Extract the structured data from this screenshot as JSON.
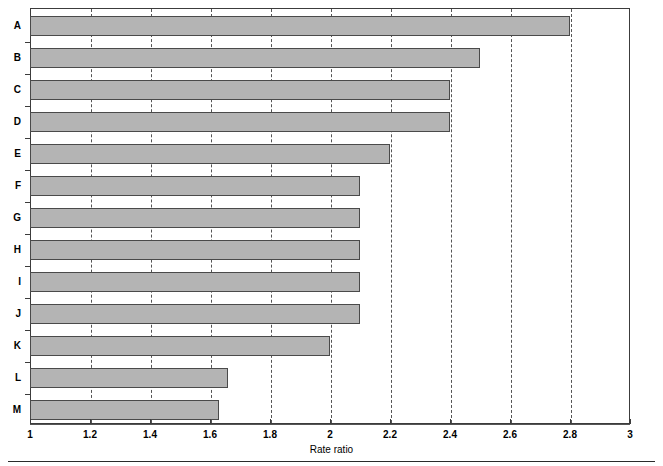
{
  "chart_data": {
    "type": "bar",
    "orientation": "horizontal",
    "title": "",
    "xlabel": "Rate ratio",
    "ylabel": "",
    "xlim": [
      1,
      3
    ],
    "ylim": null,
    "grid": "vertical-dashed",
    "legend": "none",
    "categories": [
      "A",
      "B",
      "C",
      "D",
      "E",
      "F",
      "G",
      "H",
      "I",
      "J",
      "K",
      "L",
      "M"
    ],
    "values": [
      2.8,
      2.5,
      2.4,
      2.4,
      2.2,
      2.1,
      2.1,
      2.1,
      2.1,
      2.1,
      2.0,
      1.66,
      1.63
    ],
    "xticks": [
      1,
      1.2,
      1.4,
      1.6,
      1.8,
      2,
      2.2,
      2.4,
      2.6,
      2.8,
      3
    ],
    "xticklabels": [
      "1",
      "1.2",
      "1.4",
      "1.6",
      "1.8",
      "2",
      "2.2",
      "2.4",
      "2.6",
      "2.8",
      "3"
    ],
    "series": [
      {
        "name": "Rate ratio",
        "bar_fill": "#b4b4b4",
        "bar_edge": "#4a4a4a",
        "values": [
          2.8,
          2.5,
          2.4,
          2.4,
          2.2,
          2.1,
          2.1,
          2.1,
          2.1,
          2.1,
          2.0,
          1.66,
          1.63
        ]
      }
    ]
  },
  "axis": {
    "x_title": "Rate ratio"
  }
}
